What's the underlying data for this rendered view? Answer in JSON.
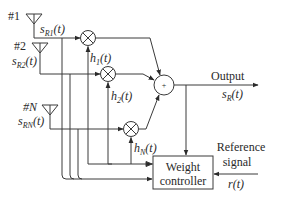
{
  "diagram": {
    "type": "adaptive-array-block-diagram",
    "antennas": [
      {
        "id": "#1",
        "signal": "s",
        "sub": "R1",
        "arg": "(t)"
      },
      {
        "id": "#2",
        "signal": "s",
        "sub": "R2",
        "arg": "(t)"
      },
      {
        "id": "#N",
        "signal": "s",
        "sub": "RN",
        "arg": "(t)"
      }
    ],
    "weights": [
      {
        "name": "h",
        "sub": "1",
        "arg": "(t)"
      },
      {
        "name": "h",
        "sub": "2",
        "arg": "(t)"
      },
      {
        "name": "h",
        "sub": "N",
        "arg": "(t)"
      }
    ],
    "summer_symbol": "+",
    "output": {
      "label": "Output",
      "signal": "s",
      "sub": "R",
      "arg": "(t)"
    },
    "controller": {
      "line1": "Weight",
      "line2": "controller"
    },
    "reference": {
      "line1": "Reference",
      "line2": "signal",
      "signal": "r(t)"
    },
    "colors": {
      "stroke": "#3a3a3a",
      "text": "#2a2a2a",
      "background": "#ffffff"
    }
  }
}
